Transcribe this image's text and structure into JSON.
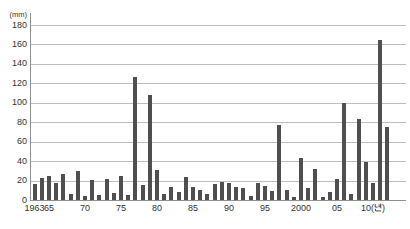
{
  "chart_data": {
    "type": "bar",
    "title": "",
    "unit_label": "(㎜)",
    "xlabel_suffix": "(년)",
    "ylabel": "",
    "ylim": [
      0,
      180
    ],
    "y_tick_step": 20,
    "y_tick_labels": [
      "0",
      "20",
      "40",
      "60",
      "80",
      "100",
      "120",
      "140",
      "160",
      "180"
    ],
    "grid": true,
    "legend": "none",
    "x_start_year": 1963,
    "x_end_year": 2012,
    "x_ticks": [
      {
        "year": 1963,
        "label": "1963"
      },
      {
        "year": 1965,
        "label": "65"
      },
      {
        "year": 1970,
        "label": "70"
      },
      {
        "year": 1975,
        "label": "75"
      },
      {
        "year": 1980,
        "label": "80"
      },
      {
        "year": 1985,
        "label": "85"
      },
      {
        "year": 1990,
        "label": "90"
      },
      {
        "year": 1995,
        "label": "95"
      },
      {
        "year": 2000,
        "label": "2000"
      },
      {
        "year": 2005,
        "label": "05"
      },
      {
        "year": 2010,
        "label": "10(년)"
      }
    ],
    "categories": [
      1963,
      1964,
      1965,
      1966,
      1967,
      1968,
      1969,
      1970,
      1971,
      1972,
      1973,
      1974,
      1975,
      1976,
      1977,
      1978,
      1979,
      1980,
      1981,
      1982,
      1983,
      1984,
      1985,
      1986,
      1987,
      1988,
      1989,
      1990,
      1991,
      1992,
      1993,
      1994,
      1995,
      1996,
      1997,
      1998,
      1999,
      2000,
      2001,
      2002,
      2003,
      2004,
      2005,
      2006,
      2007,
      2008,
      2009,
      2010,
      2011,
      2012
    ],
    "values": [
      16,
      23,
      25,
      17,
      27,
      6,
      30,
      4,
      21,
      5,
      22,
      7,
      25,
      5,
      127,
      15,
      108,
      31,
      6,
      13,
      8,
      24,
      13,
      10,
      6,
      16,
      19,
      18,
      13,
      12,
      4,
      18,
      14,
      9,
      77,
      10,
      3,
      43,
      12,
      32,
      3,
      8,
      22,
      100,
      6,
      83,
      39,
      18,
      165,
      75
    ],
    "bar_color": "#4f4f4f",
    "grid_color": "#bdbdbd",
    "axis_color": "#8f8f8f",
    "text_color": "#333333"
  }
}
